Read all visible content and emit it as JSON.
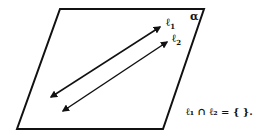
{
  "diagram": {
    "plane_label": "α",
    "line1": {
      "symbol": "ℓ",
      "subscript": "1"
    },
    "line2": {
      "symbol": "ℓ",
      "subscript": "2"
    },
    "equation": "ℓ₁ ∩ ℓ₂ = { }.",
    "colors": {
      "stroke": "#111111",
      "background": "#ffffff"
    }
  }
}
